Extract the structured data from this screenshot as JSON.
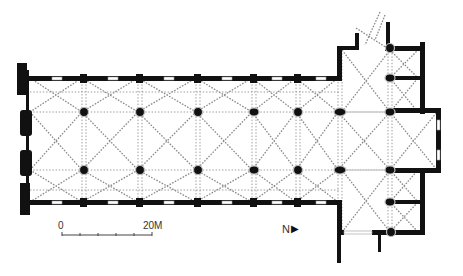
{
  "scale_bar": {
    "start_label": "0",
    "end_label": "20M",
    "ticks": 5
  },
  "north_arrow": {
    "label": "N",
    "glyph": "▶"
  },
  "plan": {
    "type": "hall-church floor plan with rib vaults",
    "nave_bays": 6,
    "aisles": 3,
    "pier_rows": 2,
    "piers_per_row": 6,
    "transept_piers": 4,
    "colors": {
      "walls": "#111111",
      "ribs": "#8a8a8a",
      "background": "#ffffff"
    }
  }
}
